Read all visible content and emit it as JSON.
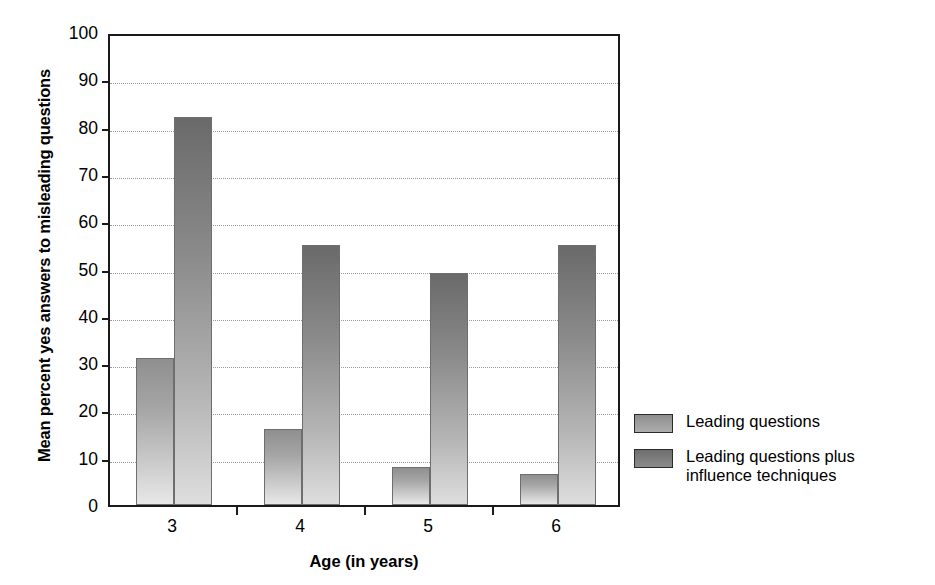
{
  "chart_data": {
    "type": "bar",
    "title": "",
    "xlabel": "Age (in years)",
    "ylabel": "Mean percent yes answers to misleading questions",
    "categories": [
      "3",
      "4",
      "5",
      "6"
    ],
    "series": [
      {
        "name": "Leading questions",
        "values": [
          31,
          16,
          8,
          6.5
        ]
      },
      {
        "name": "Leading questions plus influence techniques",
        "values": [
          82,
          55,
          49,
          55
        ]
      }
    ],
    "ylim": [
      0,
      100
    ],
    "yticks": [
      0,
      10,
      20,
      30,
      40,
      50,
      60,
      70,
      80,
      90,
      100
    ],
    "ytick_labels": [
      "0",
      "10",
      "20",
      "30",
      "40",
      "50",
      "60",
      "70",
      "80",
      "90",
      "100"
    ],
    "grid": true,
    "grid_axis": "y",
    "legend_position": "right",
    "colors": {
      "series_1": "#a0a0a0",
      "series_2": "#7a7a7a",
      "axis": "#1a1a1a",
      "gridline": "#9a9a9a",
      "background": "#ffffff"
    }
  },
  "legend": {
    "items": [
      {
        "label": "Leading questions",
        "swatch": "light"
      },
      {
        "label": "Leading questions plus influence techniques",
        "swatch": "dark"
      }
    ]
  }
}
